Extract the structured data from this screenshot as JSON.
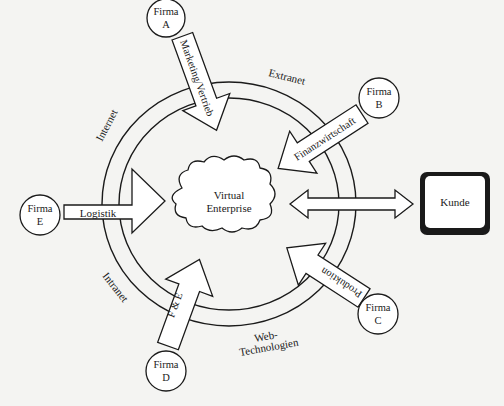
{
  "diagram": {
    "center": {
      "label_line1": "Virtual",
      "label_line2": "Enterprise"
    },
    "ring_labels": {
      "extranet": "Extranet",
      "internet": "Internet",
      "intranet": "Intranet",
      "web_line1": "Web-",
      "web_line2": "Technologien"
    },
    "firms": [
      {
        "id": "A",
        "line1": "Firma",
        "line2": "A"
      },
      {
        "id": "B",
        "line1": "Firma",
        "line2": "B"
      },
      {
        "id": "C",
        "line1": "Firma",
        "line2": "C"
      },
      {
        "id": "D",
        "line1": "Firma",
        "line2": "D"
      },
      {
        "id": "E",
        "line1": "Firma",
        "line2": "E"
      }
    ],
    "arrows": {
      "marketing": "Marketing/Vertrieb",
      "finanz": "Finanzwirtschaft",
      "produktion": "Produktion",
      "fe": "F & E",
      "logistik": "Logistik"
    },
    "customer": {
      "label": "Kunde"
    },
    "colors": {
      "stroke": "#1a1a1a",
      "fill": "#ffffff",
      "background": "#f4f4f2"
    }
  }
}
